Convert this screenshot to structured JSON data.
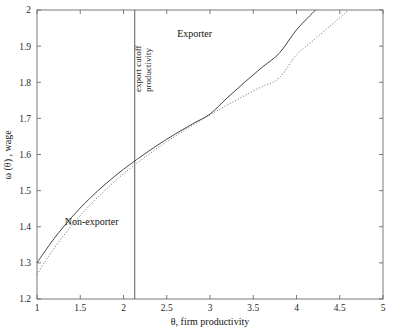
{
  "chart_data": {
    "type": "line",
    "title": "",
    "xlabel": "θ, firm productivity",
    "ylabel": "ω (θ) , wage",
    "xlim": [
      1,
      5
    ],
    "ylim": [
      1.2,
      2
    ],
    "grid": false,
    "legend_position": "inline-annotations",
    "xticks": [
      "1",
      "1.5",
      "2",
      "2.5",
      "3",
      "3.5",
      "4",
      "4.5",
      "5"
    ],
    "xtick_values": [
      1,
      1.5,
      2,
      2.5,
      3,
      3.5,
      4,
      4.5,
      5
    ],
    "yticks": [
      "1.2",
      "1.3",
      "1.4",
      "1.5",
      "1.6",
      "1.7",
      "1.8",
      "1.9",
      "2"
    ],
    "ytick_values": [
      1.2,
      1.3,
      1.4,
      1.5,
      1.6,
      1.7,
      1.8,
      1.9,
      2
    ],
    "series": [
      {
        "name": "Exporter",
        "style": "solid",
        "color": "#3a3a3a",
        "x": [
          1.0,
          1.1,
          1.2,
          1.3,
          1.4,
          1.5,
          1.6,
          1.7,
          1.8,
          1.9,
          2.0,
          2.13,
          2.2,
          2.4,
          2.6,
          2.8,
          3.0,
          3.2,
          3.4,
          3.6,
          3.8,
          4.0,
          4.22
        ],
        "y": [
          1.3,
          1.335,
          1.368,
          1.398,
          1.426,
          1.452,
          1.476,
          1.499,
          1.52,
          1.54,
          1.559,
          1.582,
          1.594,
          1.627,
          1.657,
          1.685,
          1.712,
          1.757,
          1.8,
          1.841,
          1.88,
          1.945,
          2.0
        ]
      },
      {
        "name": "Non-exporter",
        "style": "dotted",
        "color": "#6a6a6a",
        "x": [
          1.0,
          1.1,
          1.2,
          1.3,
          1.4,
          1.5,
          1.6,
          1.7,
          1.8,
          1.9,
          2.0,
          2.13,
          2.2,
          2.4,
          2.6,
          2.8,
          3.0,
          3.2,
          3.4,
          3.6,
          3.8,
          4.0,
          4.2,
          4.4,
          4.6
        ],
        "y": [
          1.268,
          1.306,
          1.341,
          1.373,
          1.403,
          1.431,
          1.457,
          1.481,
          1.504,
          1.526,
          1.547,
          1.572,
          1.584,
          1.619,
          1.651,
          1.681,
          1.71,
          1.737,
          1.763,
          1.788,
          1.812,
          1.876,
          1.917,
          1.958,
          2.0
        ]
      }
    ],
    "annotations": [
      {
        "name": "exporter-label",
        "text": "Exporter",
        "x": 2.62,
        "y": 1.925,
        "rotation": 0
      },
      {
        "name": "non-exporter-label",
        "text": "Non-exporter",
        "x": 1.32,
        "y": 1.405,
        "rotation": 0
      }
    ],
    "vertical_lines": [
      {
        "name": "export-cutoff",
        "value": 2.13,
        "label_line1": "export cutoff",
        "label_line2": "productivity",
        "rotation": -90
      }
    ]
  }
}
